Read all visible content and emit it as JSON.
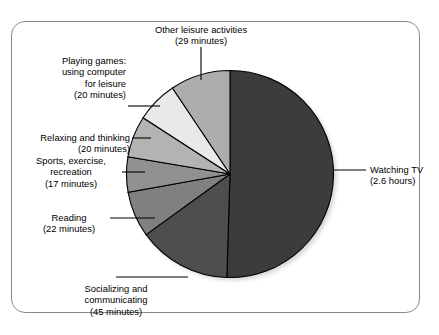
{
  "figure": {
    "cut_off_title": "Leisure time on an average day (hours per day)",
    "frame_border_color": "#8a8a8a",
    "background_color": "#ffffff"
  },
  "chart_data": {
    "type": "pie",
    "title": "",
    "unit": "minutes",
    "total_minutes": 309,
    "start_angle_deg": 0,
    "direction": "clockwise",
    "legend": "none",
    "grid": false,
    "labels": [
      "Watching TV",
      "Socializing and communicating",
      "Reading",
      "Sports, exercise, recreation",
      "Relaxing and thinking",
      "Playing games: using computer for leisure",
      "Other leisure activities"
    ],
    "values": [
      156,
      45,
      22,
      17,
      20,
      20,
      29
    ],
    "value_text": [
      "(2.6 hours)",
      "(45 minutes)",
      "(22 minutes)",
      "(17 minutes)",
      "(20 minutes)",
      "(20 minutes)",
      "(29 minutes)"
    ],
    "colors": [
      "#3c3c3c",
      "#4e4e4e",
      "#808080",
      "#919191",
      "#b3b3b3",
      "#e9e9e9",
      "#adadad"
    ],
    "slice_edge_color": "#000000"
  },
  "slices": {
    "watching_tv": {
      "name_line1": "Watching TV",
      "name_line2": "(2.6 hours)",
      "value": 156,
      "color": "#3c3c3c"
    },
    "socializing": {
      "name_line1": "Socializing and",
      "name_line2": "communicating",
      "name_line3": "(45 minutes)",
      "value": 45,
      "color": "#4e4e4e"
    },
    "reading": {
      "name_line1": "Reading",
      "name_line2": "(22 minutes)",
      "value": 22,
      "color": "#808080"
    },
    "sports": {
      "name_line1": "Sports, exercise,",
      "name_line2": "recreation",
      "name_line3": "(17 minutes)",
      "value": 17,
      "color": "#919191"
    },
    "relaxing": {
      "name_line1": "Relaxing and thinking",
      "name_line2": "(20 minutes)",
      "value": 20,
      "color": "#b3b3b3"
    },
    "playing_games": {
      "name_line1": "Playing games:",
      "name_line2": "using computer",
      "name_line3": "for leisure",
      "name_line4": "(20 minutes)",
      "value": 20,
      "color": "#e9e9e9"
    },
    "other_leisure": {
      "name_line1": "Other leisure activities",
      "name_line2": "(29 minutes)",
      "value": 29,
      "color": "#adadad"
    }
  }
}
